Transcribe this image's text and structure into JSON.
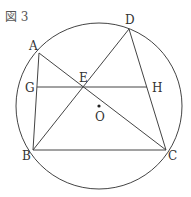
{
  "figure": {
    "title": "図 3",
    "stroke_color": "#444444",
    "circle": {
      "cx": 99,
      "cy": 106,
      "r": 83,
      "center_label": "O"
    },
    "points": {
      "A": {
        "x": 39,
        "y": 53,
        "label": "A"
      },
      "B": {
        "x": 33,
        "y": 150,
        "label": "B"
      },
      "C": {
        "x": 166,
        "y": 150,
        "label": "C"
      },
      "D": {
        "x": 129,
        "y": 29,
        "label": "D"
      },
      "E": {
        "x": 84,
        "y": 87,
        "label": "E"
      },
      "G": {
        "x": 37,
        "y": 87,
        "label": "G"
      },
      "H": {
        "x": 147,
        "y": 87,
        "label": "H"
      },
      "O": {
        "x": 99,
        "y": 106,
        "label": "O"
      }
    },
    "segments": [
      [
        "A",
        "B"
      ],
      [
        "A",
        "C"
      ],
      [
        "B",
        "D"
      ],
      [
        "D",
        "C"
      ],
      [
        "B",
        "C"
      ],
      [
        "G",
        "H"
      ]
    ]
  }
}
